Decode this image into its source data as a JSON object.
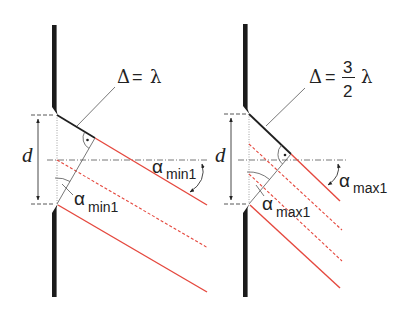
{
  "figure": {
    "left_panel": {
      "name": "minimum-first-order",
      "path_difference": {
        "delta": "Δ",
        "equals": "=",
        "value": "λ"
      },
      "slit_width_label": "d",
      "angle_label_right": {
        "symbol": "α",
        "subscript": "min1"
      },
      "angle_label_bottom": {
        "symbol": "α",
        "subscript": "min1"
      }
    },
    "right_panel": {
      "name": "maximum-first-order",
      "path_difference": {
        "delta": "Δ",
        "equals": "=",
        "numerator": "3",
        "denominator": "2",
        "value": "λ"
      },
      "slit_width_label": "d",
      "angle_label_right": {
        "symbol": "α",
        "subscript": "max1"
      },
      "angle_label_bottom": {
        "symbol": "α",
        "subscript": "max1"
      }
    },
    "colors": {
      "ray": "#e5483e",
      "wall": "#1b1b1b",
      "construction": "#555555"
    }
  }
}
